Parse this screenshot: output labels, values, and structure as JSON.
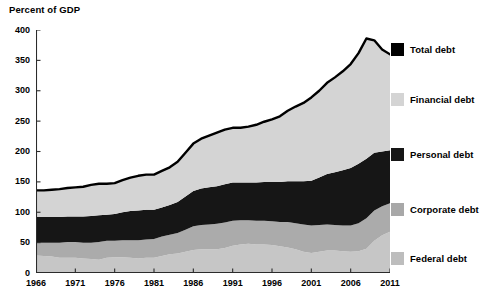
{
  "figure": {
    "axis_title": "Percent of GDP"
  },
  "legend": {
    "items": [
      {
        "label": "Total debt",
        "color": "#000000",
        "top": 12
      },
      {
        "label": "Financial debt",
        "color": "#d4d4d4",
        "top": 62
      },
      {
        "label": "Personal debt",
        "color": "#161616",
        "top": 117
      },
      {
        "label": "Corporate debt",
        "color": "#a8a8a8",
        "top": 172
      },
      {
        "label": "Federal debt",
        "color": "#bdbdbd",
        "top": 221
      }
    ]
  },
  "colors": {
    "federal": "#c6c6c6",
    "corporate": "#ababab",
    "personal": "#161616",
    "financial": "#d4d4d4",
    "total_line": "#000000",
    "axis": "#2b2b2b",
    "background": "#ffffff"
  },
  "chart_data": {
    "type": "area",
    "title": "Percent of GDP",
    "xlabel": "",
    "ylabel": "Percent of GDP",
    "stacked": true,
    "grid": false,
    "legend_position": "right",
    "xlim": [
      1966,
      2011
    ],
    "ylim": [
      0,
      400
    ],
    "ytick_values": [
      0,
      50,
      100,
      150,
      200,
      250,
      300,
      350,
      400
    ],
    "ytick_labels": [
      "0",
      "50",
      "100",
      "150",
      "200",
      "250",
      "300",
      "350",
      "400"
    ],
    "xtick_values": [
      1966,
      1971,
      1976,
      1981,
      1986,
      1991,
      1996,
      2001,
      2006,
      2011
    ],
    "xtick_labels": [
      "1966",
      "1971",
      "1976",
      "1981",
      "1986",
      "1991",
      "1996",
      "2001",
      "2006",
      "2011"
    ],
    "x": [
      1966,
      1967,
      1968,
      1969,
      1970,
      1971,
      1972,
      1973,
      1974,
      1975,
      1976,
      1977,
      1978,
      1979,
      1980,
      1981,
      1982,
      1983,
      1984,
      1985,
      1986,
      1987,
      1988,
      1989,
      1990,
      1991,
      1992,
      1993,
      1994,
      1995,
      1996,
      1997,
      1998,
      1999,
      2000,
      2001,
      2002,
      2003,
      2004,
      2005,
      2006,
      2007,
      2008,
      2009,
      2010,
      2011
    ],
    "series": [
      {
        "name": "Federal debt",
        "color": "#c6c6c6",
        "values": [
          29,
          28,
          27,
          25,
          25,
          25,
          24,
          23,
          22,
          25,
          26,
          26,
          25,
          24,
          25,
          25,
          28,
          31,
          32,
          35,
          38,
          39,
          39,
          39,
          41,
          45,
          47,
          48,
          47,
          47,
          46,
          44,
          42,
          39,
          35,
          33,
          35,
          37,
          37,
          36,
          35,
          36,
          40,
          53,
          62,
          68
        ]
      },
      {
        "name": "Corporate debt",
        "color": "#ababab",
        "values": [
          21,
          22,
          23,
          25,
          26,
          26,
          26,
          27,
          29,
          28,
          27,
          28,
          29,
          30,
          30,
          31,
          32,
          32,
          34,
          36,
          39,
          40,
          41,
          42,
          42,
          41,
          40,
          39,
          39,
          39,
          39,
          40,
          42,
          43,
          45,
          45,
          44,
          43,
          42,
          42,
          43,
          46,
          50,
          50,
          48,
          47
        ]
      },
      {
        "name": "Personal debt",
        "color": "#161616",
        "values": [
          42,
          42,
          42,
          42,
          42,
          42,
          43,
          44,
          44,
          43,
          44,
          46,
          48,
          49,
          49,
          48,
          48,
          49,
          51,
          55,
          58,
          60,
          61,
          62,
          63,
          63,
          62,
          62,
          63,
          64,
          65,
          66,
          67,
          69,
          71,
          74,
          78,
          83,
          87,
          91,
          95,
          98,
          98,
          95,
          90,
          87
        ]
      },
      {
        "name": "Financial debt",
        "color": "#d4d4d4",
        "values": [
          44,
          44,
          45,
          46,
          47,
          48,
          49,
          51,
          52,
          51,
          51,
          53,
          55,
          57,
          58,
          58,
          60,
          62,
          66,
          72,
          78,
          82,
          85,
          88,
          90,
          90,
          90,
          92,
          95,
          99,
          103,
          108,
          116,
          123,
          129,
          137,
          143,
          150,
          156,
          163,
          171,
          182,
          198,
          185,
          168,
          158
        ]
      }
    ],
    "total": {
      "name": "Total debt",
      "color": "#000000",
      "values": [
        136,
        136,
        137,
        138,
        140,
        141,
        142,
        145,
        147,
        147,
        148,
        153,
        157,
        160,
        162,
        162,
        168,
        174,
        183,
        198,
        213,
        221,
        226,
        231,
        236,
        239,
        239,
        241,
        244,
        249,
        253,
        258,
        267,
        274,
        280,
        289,
        300,
        313,
        322,
        332,
        344,
        362,
        386,
        383,
        368,
        360
      ]
    },
    "annotations": []
  }
}
